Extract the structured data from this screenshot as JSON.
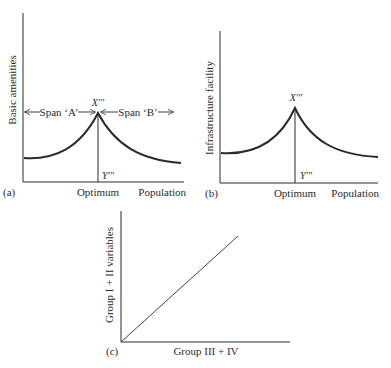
{
  "figure": {
    "panels": [
      {
        "id": "a",
        "panel_label": "(a)",
        "y_axis_label": "Basic amenities",
        "x_axis_label": "Population",
        "x_tick_label": "Optimum",
        "peak_label": "X'''",
        "foot_label": "Y'''",
        "span_left": "Span ‘A’",
        "span_right": "Span ‘B’"
      },
      {
        "id": "b",
        "panel_label": "(b)",
        "y_axis_label": "Infrastructure facility",
        "x_axis_label": "Population",
        "x_tick_label": "Optimum",
        "peak_label": "X'''",
        "foot_label": "Y'''"
      },
      {
        "id": "c",
        "panel_label": "(c)",
        "y_axis_label": "Group I + II variables",
        "x_axis_label": "Group III + IV"
      }
    ],
    "colors": {
      "line": "#2a2a2a",
      "background": "#ffffff"
    }
  }
}
